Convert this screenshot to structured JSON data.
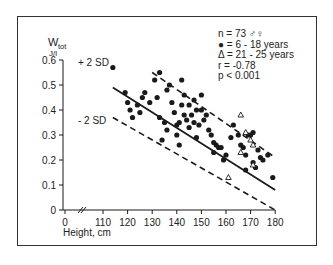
{
  "chart_data": {
    "type": "scatter",
    "title": "",
    "xlabel": "Height, cm",
    "ylabel": "W_tot J/l",
    "ylabel_main": "W",
    "ylabel_sub": "tot",
    "ylabel_unit": "J/l",
    "xlim": [
      0,
      180
    ],
    "ylim": [
      0,
      0.6
    ],
    "x_axis_break": true,
    "x_ticks": [
      "0",
      "110",
      "120",
      "130",
      "140",
      "150",
      "160",
      "170",
      "180"
    ],
    "y_ticks": [
      "0",
      "0.1",
      "0.2",
      "0.3",
      "0.4",
      "0.5",
      "0.6"
    ],
    "grid": false,
    "legend": {
      "position": "top-right",
      "lines": [
        "n = 73 ♂♀",
        "● = 6 - 18 years",
        "Δ = 21 - 25 years",
        "r = -0.78",
        "p < 0.001"
      ]
    },
    "annotations": {
      "upper_band": "+ 2 SD",
      "lower_band": "- 2 SD"
    },
    "regression_line": {
      "x": [
        114,
        180
      ],
      "y": [
        0.49,
        0.08
      ]
    },
    "upper_2sd_line": {
      "x": [
        130,
        180
      ],
      "y": [
        0.55,
        0.21
      ]
    },
    "lower_2sd_line": {
      "x": [
        114,
        180
      ],
      "y": [
        0.37,
        0.0
      ]
    },
    "series": [
      {
        "name": "6 - 18 years",
        "marker": "filled-circle",
        "points": [
          [
            114,
            0.57
          ],
          [
            119,
            0.47
          ],
          [
            120,
            0.43
          ],
          [
            121,
            0.4
          ],
          [
            122,
            0.37
          ],
          [
            124,
            0.42
          ],
          [
            125,
            0.39
          ],
          [
            126,
            0.45
          ],
          [
            127,
            0.47
          ],
          [
            129,
            0.43
          ],
          [
            131,
            0.52
          ],
          [
            132,
            0.45
          ],
          [
            133,
            0.55
          ],
          [
            133,
            0.37
          ],
          [
            134,
            0.28
          ],
          [
            135,
            0.35
          ],
          [
            136,
            0.48
          ],
          [
            136,
            0.32
          ],
          [
            137,
            0.5
          ],
          [
            138,
            0.43
          ],
          [
            139,
            0.39
          ],
          [
            140,
            0.34
          ],
          [
            140,
            0.3
          ],
          [
            141,
            0.35
          ],
          [
            141,
            0.26
          ],
          [
            142,
            0.52
          ],
          [
            142,
            0.42
          ],
          [
            143,
            0.38
          ],
          [
            143,
            0.46
          ],
          [
            144,
            0.36
          ],
          [
            145,
            0.33
          ],
          [
            145,
            0.42
          ],
          [
            146,
            0.38
          ],
          [
            147,
            0.44
          ],
          [
            147,
            0.35
          ],
          [
            148,
            0.29
          ],
          [
            148,
            0.4
          ],
          [
            149,
            0.34
          ],
          [
            150,
            0.46
          ],
          [
            150,
            0.4
          ],
          [
            151,
            0.36
          ],
          [
            152,
            0.38
          ],
          [
            153,
            0.32
          ],
          [
            154,
            0.3
          ],
          [
            155,
            0.27
          ],
          [
            155,
            0.23
          ],
          [
            156,
            0.26
          ],
          [
            157,
            0.25
          ],
          [
            158,
            0.25
          ],
          [
            159,
            0.2
          ],
          [
            160,
            0.22
          ],
          [
            162,
            0.29
          ],
          [
            163,
            0.34
          ],
          [
            165,
            0.3
          ],
          [
            166,
            0.26
          ],
          [
            167,
            0.25
          ],
          [
            168,
            0.22
          ],
          [
            168,
            0.16
          ],
          [
            169,
            0.3
          ],
          [
            170,
            0.3
          ],
          [
            171,
            0.31
          ],
          [
            171,
            0.19
          ],
          [
            172,
            0.17
          ],
          [
            173,
            0.24
          ],
          [
            174,
            0.21
          ],
          [
            175,
            0.2
          ],
          [
            177,
            0.22
          ],
          [
            179,
            0.13
          ]
        ]
      },
      {
        "name": "21 - 25 years",
        "marker": "open-triangle",
        "points": [
          [
            166,
            0.38
          ],
          [
            168,
            0.31
          ],
          [
            171,
            0.26
          ],
          [
            166,
            0.23
          ],
          [
            170,
            0.28
          ],
          [
            161,
            0.13
          ],
          [
            171,
            0.18
          ]
        ]
      }
    ]
  },
  "colors": {
    "ink": "#1a1a1a",
    "frame": "#333333",
    "background": "#ffffff"
  }
}
